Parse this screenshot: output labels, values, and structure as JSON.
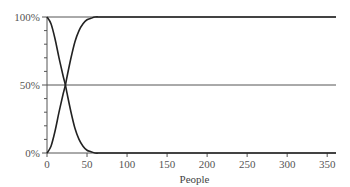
{
  "chart_data": {
    "type": "line",
    "title": "",
    "xlabel": "People",
    "ylabel": "",
    "xlim": [
      0,
      361
    ],
    "ylim": [
      0,
      100
    ],
    "x_ticks": [
      0,
      50,
      100,
      150,
      200,
      250,
      300,
      350
    ],
    "x_tick_labels": [
      "0",
      "50",
      "100",
      "150",
      "200",
      "250",
      "300",
      "350"
    ],
    "y_ticks": [
      0,
      50,
      100
    ],
    "y_tick_labels": [
      "0%",
      "50%",
      "100%"
    ],
    "y_minor_ticks": [
      10,
      20,
      30,
      40,
      60,
      70,
      80,
      90
    ],
    "grid": "horizontal lines at 0%, 50%, 100%",
    "legend": null,
    "series": [
      {
        "name": "decreasing",
        "x": [
          0,
          5,
          10,
          15,
          20,
          23,
          25,
          30,
          35,
          40,
          45,
          50,
          55,
          60,
          70,
          100,
          200,
          300,
          361
        ],
        "values": [
          100,
          95,
          84,
          70,
          57,
          50,
          44,
          30,
          18,
          10,
          5,
          2,
          1,
          0,
          0,
          0,
          0,
          0,
          0
        ]
      },
      {
        "name": "increasing",
        "x": [
          0,
          5,
          10,
          15,
          20,
          23,
          25,
          30,
          35,
          40,
          45,
          50,
          55,
          60,
          70,
          100,
          200,
          300,
          361
        ],
        "values": [
          0,
          5,
          16,
          30,
          43,
          50,
          56,
          70,
          82,
          90,
          95,
          98,
          99,
          100,
          100,
          100,
          100,
          100,
          100
        ]
      }
    ]
  },
  "layout": {
    "plot_left": 47,
    "plot_right": 336,
    "plot_top": 17,
    "plot_bottom": 153,
    "line_color": "#222222",
    "grid_color": "#555555"
  }
}
